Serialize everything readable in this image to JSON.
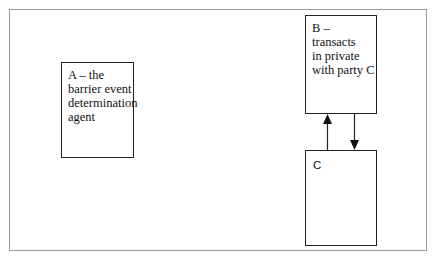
{
  "diagram": {
    "nodes": [
      {
        "id": "A",
        "label": "A – the\nbarrier event\ndetermination\nagent"
      },
      {
        "id": "B",
        "label": "B – transacts\nin private\nwith party C"
      },
      {
        "id": "C",
        "label": "C"
      }
    ],
    "edges": [
      {
        "from": "C",
        "to": "B",
        "direction": "up"
      },
      {
        "from": "B",
        "to": "C",
        "direction": "down"
      }
    ]
  }
}
